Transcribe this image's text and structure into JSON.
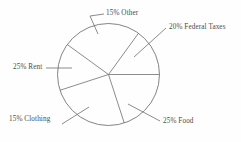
{
  "figure": {
    "background_color": "#fefefe",
    "stroke_color": "#6e6e6e",
    "text_color": "#4a4a4a"
  },
  "chart_data": {
    "type": "pie",
    "title": "",
    "subtitle": "",
    "xlabel": "",
    "ylabel": "",
    "grid": false,
    "legend": "none",
    "labels_position": "outside-with-leader-lines",
    "filled": false,
    "center": {
      "x": 108.5,
      "y": 74.5
    },
    "radius": 51,
    "start_angle_deg": 0,
    "direction": "clockwise",
    "categories": [
      "Federal Taxes",
      "Food",
      "Clothing",
      "Rent",
      "Other"
    ],
    "values": [
      20,
      25,
      15,
      25,
      15
    ],
    "units": "percent",
    "total": 100,
    "slices": [
      {
        "name": "federal-taxes",
        "label": "20% Federal Taxes",
        "percent": 20,
        "start_deg": 0,
        "end_deg": 72,
        "leader_from": {
          "x": 134,
          "y": 57
        },
        "leader_to": {
          "x": 166,
          "y": 28
        }
      },
      {
        "name": "food",
        "label": "25% Food",
        "percent": 25,
        "start_deg": 72,
        "end_deg": 162,
        "leader_from": {
          "x": 128,
          "y": 104
        },
        "leader_to": {
          "x": 160,
          "y": 121
        }
      },
      {
        "name": "clothing",
        "label": "15% Clothing",
        "percent": 15,
        "start_deg": 162,
        "end_deg": 216,
        "leader_from": {
          "x": 89,
          "y": 107
        },
        "leader_to": {
          "x": 62,
          "y": 124
        }
      },
      {
        "name": "rent",
        "label": "25% Rent",
        "percent": 25,
        "start_deg": 216,
        "end_deg": 306,
        "leader_from": {
          "x": 72,
          "y": 68
        },
        "leader_to": {
          "x": 46,
          "y": 68
        }
      },
      {
        "name": "other",
        "label": "15% Other",
        "percent": 15,
        "start_deg": 306,
        "end_deg": 360,
        "leader_from": {
          "x": 98,
          "y": 34
        },
        "leader_to": {
          "x": 90,
          "y": 16
        }
      }
    ]
  },
  "labels": {
    "other": "15% Other",
    "federal_taxes": "20% Federal Taxes",
    "rent": "25% Rent",
    "clothing": "15% Clothing",
    "food": "25% Food"
  }
}
